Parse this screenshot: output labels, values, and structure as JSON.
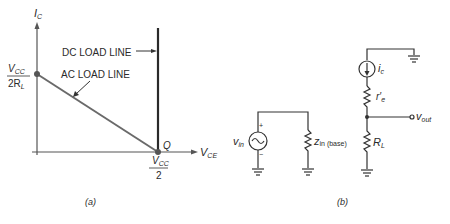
{
  "panel_a": {
    "caption": "(a)",
    "y_axis_label": "I",
    "y_axis_sub": "C",
    "x_axis_label": "V",
    "x_axis_sub": "CE",
    "dc_load_line_label": "DC LOAD LINE",
    "ac_load_line_label": "AC LOAD LINE",
    "q_point_label": "Q",
    "y_intercept": {
      "num": "V",
      "num_sub": "CC",
      "den": "2R",
      "den_sub": "L"
    },
    "x_intercept": {
      "num": "V",
      "num_sub": "CC",
      "den": "2"
    },
    "colors": {
      "ac_line": "#6a6a6a",
      "dc_line": "#2a2a2a",
      "axes": "#555555"
    }
  },
  "panel_b": {
    "caption": "(b)",
    "source_label": "v",
    "source_sub": "in",
    "source_plus": "+",
    "source_minus": "−",
    "zin_label": "z",
    "zin_sub": "in (base)",
    "current_source_label": "i",
    "current_source_sub": "c",
    "re_label": "r′",
    "re_sub": "e",
    "rl_label": "R",
    "rl_sub": "L",
    "vout_label": "v",
    "vout_sub": "out"
  }
}
